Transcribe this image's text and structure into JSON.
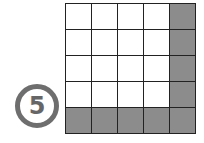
{
  "label": {
    "text": "5",
    "style": "circled-number"
  },
  "grid": {
    "rows": 5,
    "cols": 5,
    "colors": {
      "shaded": "#8c8c8c",
      "unshaded": "#ffffff",
      "line": "#222222"
    },
    "cells": [
      [
        0,
        0,
        0,
        0,
        1
      ],
      [
        0,
        0,
        0,
        0,
        1
      ],
      [
        0,
        0,
        0,
        0,
        1
      ],
      [
        0,
        0,
        0,
        0,
        1
      ],
      [
        1,
        1,
        1,
        1,
        1
      ]
    ],
    "shaded_count": 9,
    "total_count": 25
  }
}
